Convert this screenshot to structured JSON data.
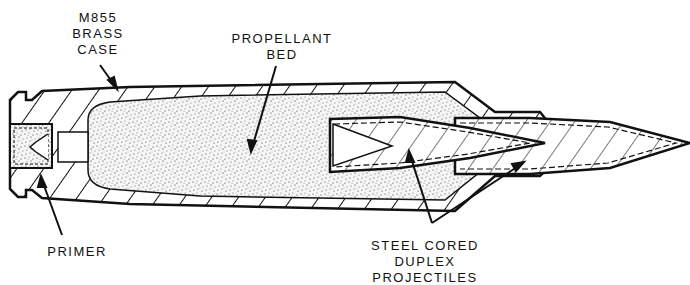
{
  "colors": {
    "ink": "#111111",
    "paper": "#ffffff",
    "propellant": "#bbbbbb"
  },
  "labels": {
    "case": [
      "M855",
      "BRASS",
      "CASE"
    ],
    "propellant": [
      "PROPELLANT",
      "BED"
    ],
    "primer": [
      "PRIMER"
    ],
    "projectiles": [
      "STEEL CORED",
      "DUPLEX",
      "PROJECTILES"
    ]
  },
  "components": [
    {
      "id": "brass-case",
      "name": "M855 brass case"
    },
    {
      "id": "propellant-bed",
      "name": "Propellant bed"
    },
    {
      "id": "primer",
      "name": "Primer"
    },
    {
      "id": "rear-projectile",
      "name": "Rear steel cored projectile"
    },
    {
      "id": "front-projectile",
      "name": "Front steel cored projectile"
    }
  ]
}
